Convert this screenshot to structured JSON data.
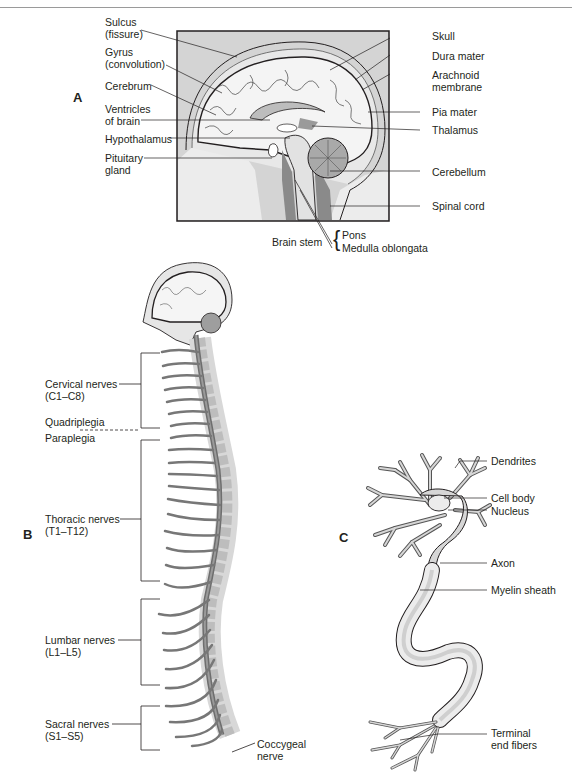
{
  "figure": {
    "panels": [
      {
        "id": "A",
        "title": "Brain sagittal section"
      },
      {
        "id": "B",
        "title": "Spinal cord and spinal nerves"
      },
      {
        "id": "C",
        "title": "Neuron"
      }
    ]
  },
  "panel_a": {
    "letter": "A",
    "left_labels": {
      "sulcus_1": "Sulcus",
      "sulcus_2": "(fissure)",
      "gyrus_1": "Gyrus",
      "gyrus_2": "(convolution)",
      "cerebrum": "Cerebrum",
      "ventricles_1": "Ventricles",
      "ventricles_2": "of brain",
      "hypothalamus": "Hypothalamus",
      "pituitary_1": "Pituitary",
      "pituitary_2": "gland"
    },
    "right_labels": {
      "skull": "Skull",
      "dura": "Dura mater",
      "arachnoid_1": "Arachnoid",
      "arachnoid_2": "membrane",
      "pia": "Pia mater",
      "thalamus": "Thalamus",
      "cerebellum": "Cerebellum",
      "spinal_cord": "Spinal cord"
    },
    "bottom_labels": {
      "brain_stem": "Brain stem",
      "brace": "{",
      "pons": "Pons",
      "medulla": "Medulla oblongata"
    }
  },
  "panel_b": {
    "letter": "B",
    "labels": {
      "cervical_1": "Cervical nerves",
      "cervical_2": "(C1–C8)",
      "quadriplegia": "Quadriplegia",
      "paraplegia": "Paraplegia",
      "thoracic_1": "Thoracic nerves",
      "thoracic_2": "(T1–T12)",
      "lumbar_1": "Lumbar nerves",
      "lumbar_2": "(L1–L5)",
      "sacral_1": "Sacral nerves",
      "sacral_2": "(S1–S5)",
      "coccygeal_1": "Coccygeal",
      "coccygeal_2": "nerve"
    }
  },
  "panel_c": {
    "letter": "C",
    "labels": {
      "dendrites": "Dendrites",
      "cell_body": "Cell body",
      "nucleus": "Nucleus",
      "axon": "Axon",
      "myelin": "Myelin sheath",
      "terminal_1": "Terminal",
      "terminal_2": "end fibers"
    }
  },
  "colors": {
    "line": "#231f20",
    "box_fill": "#cfcfcf",
    "brain_fill": "#f2f2f2",
    "dark_fill": "#8c8c8c",
    "light_fill": "#e3e3e3"
  }
}
